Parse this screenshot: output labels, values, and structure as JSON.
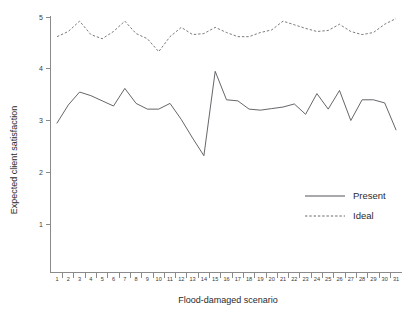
{
  "chart_data": {
    "type": "line",
    "title": "",
    "xlabel": "Flood-damaged scenario",
    "ylabel": "Expected client satisfaction",
    "xlim": [
      0.5,
      31.5
    ],
    "ylim": [
      0,
      5.15
    ],
    "grid": false,
    "legend_position": "center-right",
    "x": [
      1,
      2,
      3,
      4,
      5,
      6,
      7,
      8,
      9,
      10,
      11,
      12,
      13,
      14,
      15,
      16,
      17,
      18,
      19,
      20,
      21,
      22,
      23,
      24,
      25,
      26,
      27,
      28,
      29,
      30,
      31
    ],
    "xtick_labels": [
      "1",
      "2",
      "3",
      "4",
      "5",
      "6",
      "7",
      "8",
      "9",
      "10",
      "11",
      "12",
      "13",
      "14",
      "15",
      "16",
      "17",
      "18",
      "19",
      "20",
      "21",
      "22",
      "23",
      "24",
      "25",
      "26",
      "27",
      "28",
      "29",
      "30",
      "31"
    ],
    "ytick_labels": [
      "1",
      "2",
      "3",
      "4",
      "5"
    ],
    "yticks": [
      1,
      2,
      3,
      4,
      5
    ],
    "series": [
      {
        "name": "Present",
        "style": "solid",
        "color": "#53535a",
        "values": [
          2.95,
          3.3,
          3.55,
          3.48,
          3.38,
          3.28,
          3.62,
          3.33,
          3.22,
          3.22,
          3.33,
          3.02,
          2.66,
          2.32,
          3.95,
          3.4,
          3.38,
          3.22,
          3.2,
          3.23,
          3.26,
          3.32,
          3.12,
          3.52,
          3.22,
          3.58,
          3.0,
          3.4,
          3.4,
          3.34,
          2.82
        ]
      },
      {
        "name": "Ideal",
        "style": "dashed",
        "color": "#6a6a72",
        "values": [
          4.62,
          4.72,
          4.92,
          4.66,
          4.58,
          4.72,
          4.92,
          4.68,
          4.58,
          4.33,
          4.62,
          4.8,
          4.66,
          4.68,
          4.8,
          4.7,
          4.62,
          4.62,
          4.7,
          4.75,
          4.92,
          4.85,
          4.78,
          4.72,
          4.74,
          4.86,
          4.72,
          4.66,
          4.7,
          4.86,
          4.97
        ]
      }
    ]
  },
  "legend": {
    "items": [
      {
        "label": "Present",
        "style": "solid"
      },
      {
        "label": "Ideal",
        "style": "dashed"
      }
    ]
  }
}
